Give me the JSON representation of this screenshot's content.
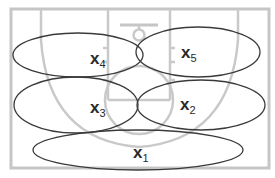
{
  "diagram": {
    "colors": {
      "court_lines": "#c6c6c6",
      "zone_outline": "#3a3a3a",
      "label": "#2a2a2a",
      "background": "#ffffff"
    },
    "zones": [
      {
        "id": "x1",
        "label": "x",
        "subscript": "1",
        "cx": 138,
        "cy": 150,
        "rx": 105,
        "ry": 20,
        "label_x": 133,
        "label_y": 158
      },
      {
        "id": "x2",
        "label": "x",
        "subscript": "2",
        "cx": 201,
        "cy": 105,
        "rx": 64,
        "ry": 25,
        "label_x": 180,
        "label_y": 110
      },
      {
        "id": "x3",
        "label": "x",
        "subscript": "3",
        "cx": 76,
        "cy": 105,
        "rx": 62,
        "ry": 28,
        "label_x": 90,
        "label_y": 113
      },
      {
        "id": "x4",
        "label": "x",
        "subscript": "4",
        "cx": 78,
        "cy": 55,
        "rx": 65,
        "ry": 22,
        "label_x": 90,
        "label_y": 64
      },
      {
        "id": "x5",
        "label": "x",
        "subscript": "5",
        "cx": 198,
        "cy": 52,
        "rx": 62,
        "ry": 25,
        "label_x": 181,
        "label_y": 58
      }
    ]
  }
}
